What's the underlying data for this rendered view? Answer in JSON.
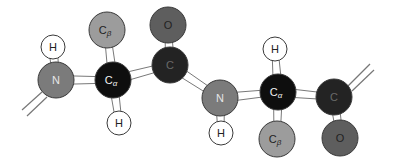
{
  "diagram": {
    "title": "",
    "colors": {
      "N": "#7b7b7b",
      "Cb": "#9c9c9c",
      "O": "#5e5e5e",
      "Ca": "#0e0e0e",
      "C": "#232323",
      "H": "#ffffff",
      "outline": "#3a3a3a",
      "bond": "#ffffff",
      "bond_outline": "#555555",
      "label_dark": "#222222",
      "label_light": "#e6e6e6"
    },
    "atoms": [
      {
        "id": "H1",
        "element": "H",
        "label": "H",
        "sub": ""
      },
      {
        "id": "N1",
        "element": "N",
        "label": "N",
        "sub": ""
      },
      {
        "id": "CB1",
        "element": "Cb",
        "label": "C",
        "sub": "β"
      },
      {
        "id": "CA1",
        "element": "Ca",
        "label": "C",
        "sub": "α"
      },
      {
        "id": "H2",
        "element": "H",
        "label": "H",
        "sub": ""
      },
      {
        "id": "O1",
        "element": "O",
        "label": "O",
        "sub": ""
      },
      {
        "id": "C1",
        "element": "C",
        "label": "C",
        "sub": ""
      },
      {
        "id": "N2",
        "element": "N",
        "label": "N",
        "sub": ""
      },
      {
        "id": "H3",
        "element": "H",
        "label": "H",
        "sub": ""
      },
      {
        "id": "H4",
        "element": "H",
        "label": "H",
        "sub": ""
      },
      {
        "id": "CA2",
        "element": "Ca",
        "label": "C",
        "sub": "α"
      },
      {
        "id": "CB2",
        "element": "Cb",
        "label": "C",
        "sub": "β"
      },
      {
        "id": "C2",
        "element": "C",
        "label": "C",
        "sub": ""
      },
      {
        "id": "O2",
        "element": "O",
        "label": "O",
        "sub": ""
      }
    ],
    "bonds": [
      [
        "H1",
        "N1"
      ],
      [
        "N1",
        "CA1"
      ],
      [
        "CA1",
        "CB1"
      ],
      [
        "CA1",
        "H2"
      ],
      [
        "CA1",
        "C1"
      ],
      [
        "C1",
        "O1"
      ],
      [
        "C1",
        "N2"
      ],
      [
        "N2",
        "H3"
      ],
      [
        "N2",
        "CA2"
      ],
      [
        "CA2",
        "H4"
      ],
      [
        "CA2",
        "CB2"
      ],
      [
        "CA2",
        "C2"
      ],
      [
        "C2",
        "O2"
      ]
    ],
    "stubs": [
      {
        "from": "N1",
        "direction": "down-left"
      },
      {
        "from": "C2",
        "direction": "up-right"
      }
    ]
  }
}
